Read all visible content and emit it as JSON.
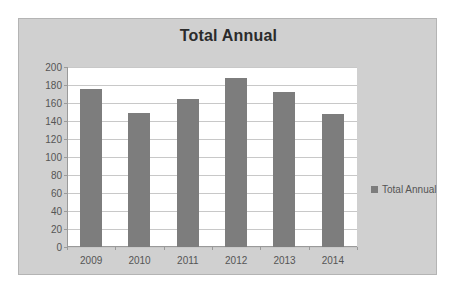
{
  "chart_data": {
    "type": "bar",
    "title": "Total Annual",
    "xlabel": "",
    "ylabel": "",
    "categories": [
      "2009",
      "2010",
      "2011",
      "2012",
      "2013",
      "2014"
    ],
    "series": [
      {
        "name": "Total Annual",
        "values": [
          176,
          149,
          165,
          188,
          172,
          148
        ]
      }
    ],
    "ylim": [
      0,
      200
    ],
    "yticks": [
      0,
      20,
      40,
      60,
      80,
      100,
      120,
      140,
      160,
      180,
      200
    ],
    "ytick_labels": [
      "0",
      "20",
      "40",
      "60",
      "80",
      "100",
      "120",
      "140",
      "160",
      "180",
      "200"
    ],
    "grid": true,
    "legend": {
      "position": "right",
      "entries": [
        {
          "label": "Total Annual",
          "color": "#7d7d7d"
        }
      ]
    },
    "colors": {
      "bar": "#7d7d7d",
      "plot_background": "#ffffff",
      "chart_background": "#d0d0d0",
      "gridline": "#c8c8c8",
      "axis": "#9a9a9a",
      "title_text": "#2b2b2b",
      "tick_text": "#555555"
    }
  }
}
